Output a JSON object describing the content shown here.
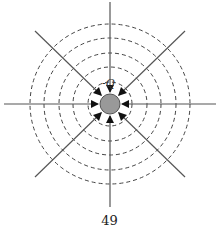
{
  "figure": {
    "center": [
      110,
      104
    ],
    "charge": {
      "label": "-Q",
      "radius": 10,
      "fill": "#999999",
      "stroke": "#555555"
    },
    "field_lines": {
      "count": 8,
      "length": 104,
      "direction": "inward",
      "color": "#555555"
    },
    "equipotentials": {
      "radii": [
        22,
        37,
        51,
        66,
        80
      ],
      "style": "dashed",
      "color": "#444444"
    }
  },
  "page": {
    "number": "49"
  }
}
